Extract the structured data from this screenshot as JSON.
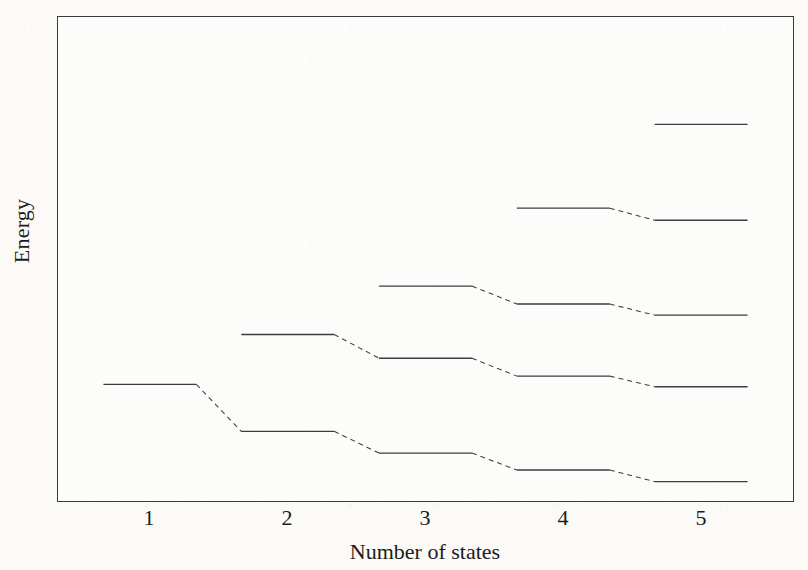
{
  "figure": {
    "kind": "scanned textbook figure",
    "line_color": "#3d3d3d",
    "border_color": "#3a3a3a",
    "background_color": "#fbfaf7",
    "text_color": "#1b1b1b"
  },
  "chart_data": {
    "type": "line",
    "subtype": "energy-level-correlation-diagram",
    "title": "",
    "xlabel": "Number of states",
    "ylabel": "Energy",
    "x_tick_labels": [
      "1",
      "2",
      "3",
      "4",
      "5"
    ],
    "y_axis": {
      "tick_labels_visible": false,
      "units": "arbitrary (percent of plot height)",
      "range": [
        0,
        100
      ]
    },
    "grid": false,
    "legend": "none",
    "level_line_style": "solid",
    "connection_line_style": "dashed",
    "columns": [
      {
        "states": 1,
        "levels": [
          24.1
        ]
      },
      {
        "states": 2,
        "levels": [
          14.4,
          34.4
        ]
      },
      {
        "states": 3,
        "levels": [
          9.9,
          29.5,
          44.4
        ]
      },
      {
        "states": 4,
        "levels": [
          6.4,
          25.8,
          40.7,
          60.5
        ]
      },
      {
        "states": 5,
        "levels": [
          4.0,
          23.6,
          38.4,
          58.0,
          77.8
        ]
      }
    ],
    "connections": [
      {
        "from_col": 0,
        "from_level": 0,
        "to_col": 1,
        "to_level": 0
      },
      {
        "from_col": 1,
        "from_level": 0,
        "to_col": 2,
        "to_level": 0
      },
      {
        "from_col": 1,
        "from_level": 1,
        "to_col": 2,
        "to_level": 1
      },
      {
        "from_col": 2,
        "from_level": 0,
        "to_col": 3,
        "to_level": 0
      },
      {
        "from_col": 2,
        "from_level": 1,
        "to_col": 3,
        "to_level": 1
      },
      {
        "from_col": 2,
        "from_level": 2,
        "to_col": 3,
        "to_level": 2
      },
      {
        "from_col": 3,
        "from_level": 0,
        "to_col": 4,
        "to_level": 0
      },
      {
        "from_col": 3,
        "from_level": 1,
        "to_col": 4,
        "to_level": 1
      },
      {
        "from_col": 3,
        "from_level": 2,
        "to_col": 4,
        "to_level": 2
      },
      {
        "from_col": 3,
        "from_level": 3,
        "to_col": 4,
        "to_level": 3
      }
    ]
  }
}
